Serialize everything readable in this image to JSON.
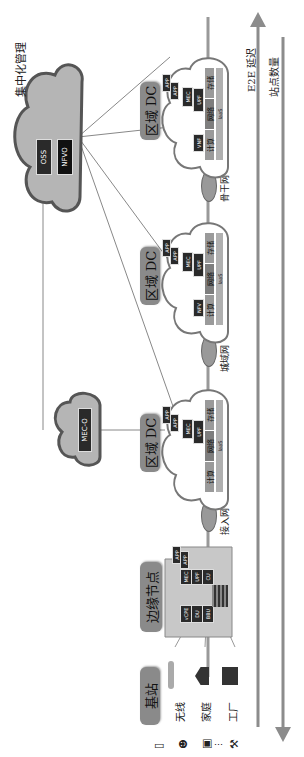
{
  "figure": {
    "orientation": "rotated-90-clockwise",
    "central_management": {
      "title": "集中化管理",
      "components": [
        "OSS",
        "NFVO"
      ]
    },
    "mec_orchestrator": {
      "label": "MEC-O"
    },
    "access_sources": {
      "base_station": "基站",
      "categories": [
        "无线",
        "家庭",
        "工厂"
      ],
      "device_icons": [
        "tablet-icon",
        "person-icon",
        "car-icon",
        "dots-icon",
        "robot-arm-icon"
      ]
    },
    "edge_node": {
      "label": "边缘节点",
      "apps": [
        "APP",
        "APP"
      ],
      "functions": [
        "MEC",
        "UPF",
        "CU"
      ],
      "ran_functions": [
        "vCPE",
        "DU",
        "BBU"
      ]
    },
    "networks": [
      "接入网",
      "城域网",
      "骨干网"
    ],
    "regional_dcs": [
      {
        "label": "区域 DC",
        "apps": [
          "APP",
          "APP"
        ],
        "functions": [
          "MEC",
          "UPF"
        ],
        "resources": [
          "计算",
          "网络",
          "存储"
        ],
        "layer": "IaaS"
      },
      {
        "label": "区域 DC",
        "apps": [
          "APP",
          "APP"
        ],
        "functions": [
          "MEC",
          "UPF",
          "NFV"
        ],
        "resources": [
          "计算",
          "网络",
          "存储"
        ],
        "layer": "IaaS"
      },
      {
        "label": "区域 DC",
        "apps": [
          "APP",
          "APP"
        ],
        "functions": [
          "MEC",
          "UPF",
          "VNF"
        ],
        "resources": [
          "计算",
          "网络",
          "存储"
        ],
        "layer": "IaaS"
      }
    ],
    "axes": {
      "latency": "E2E 延迟",
      "site_count": "站点数量"
    },
    "colors": {
      "cloud_fill": "#ffffff",
      "cloud_outline": "#6e6e6e",
      "mgmt_cloud_fill": "#b5b5b5",
      "label_box": "#8a8a8a",
      "chip_dark": "#2a2a2a",
      "arrow": "#8c8c8c"
    }
  }
}
